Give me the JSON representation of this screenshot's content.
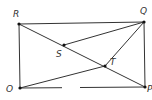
{
  "diagram": {
    "type": "geometry",
    "points": [
      {
        "name": "R",
        "x": 19,
        "y": 24,
        "label_x": 13,
        "label_y": 17
      },
      {
        "name": "Q",
        "x": 144,
        "y": 22,
        "label_x": 140,
        "label_y": 14
      },
      {
        "name": "O",
        "x": 20,
        "y": 88,
        "label_x": 6,
        "label_y": 92
      },
      {
        "name": "P",
        "x": 145,
        "y": 87,
        "label_x": 147,
        "label_y": 92
      },
      {
        "name": "S",
        "x": 64,
        "y": 45,
        "label_x": 56,
        "label_y": 57
      },
      {
        "name": "T",
        "x": 105,
        "y": 66,
        "label_x": 110,
        "label_y": 65
      }
    ],
    "segments": [
      {
        "from": "R",
        "to": "Q"
      },
      {
        "from": "R",
        "to": "O"
      },
      {
        "from": "Q",
        "to": "P"
      },
      {
        "from": "R",
        "to": "P"
      },
      {
        "from": "S",
        "to": "Q"
      },
      {
        "from": "T",
        "to": "Q"
      },
      {
        "from": "O",
        "to": "T"
      },
      {
        "from": "O",
        "to": "gap_start"
      },
      {
        "from": "gap_end",
        "to": "P"
      }
    ],
    "bottom_gap": {
      "start_x": 62,
      "end_x": 80,
      "y": 87.5
    },
    "colors": {
      "stroke": "#333333",
      "point": "#111111",
      "background": "#ffffff"
    }
  }
}
